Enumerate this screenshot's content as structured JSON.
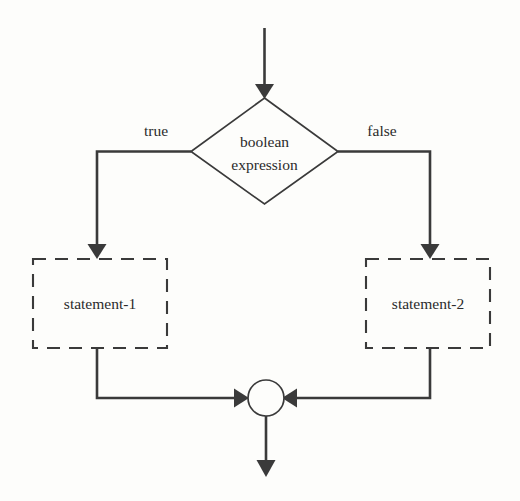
{
  "diagram": {
    "type": "flowchart",
    "background_color": "#fdfdfb",
    "line_color": "#3a3a3a",
    "text_color": "#2b2b2b",
    "nodes": {
      "entry": {
        "shape": "arrow",
        "label": ""
      },
      "decision": {
        "shape": "diamond",
        "label_line1": "boolean",
        "label_line2": "expression"
      },
      "true_branch": {
        "shape": "dashed-rect",
        "label": "statement-1"
      },
      "false_branch": {
        "shape": "dashed-rect",
        "label": "statement-2"
      },
      "merge": {
        "shape": "circle",
        "label": ""
      },
      "exit": {
        "shape": "arrow",
        "label": ""
      }
    },
    "edge_labels": {
      "true": "true",
      "false": "false"
    }
  }
}
